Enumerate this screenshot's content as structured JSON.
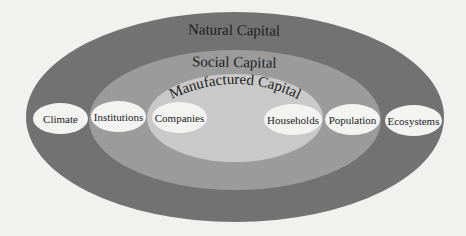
{
  "diagram": {
    "layers": [
      {
        "label": "Natural Capital",
        "color": "#727272"
      },
      {
        "label": "Social Capital",
        "color": "#9b9b9b"
      },
      {
        "label": "Manufactured Capital",
        "color": "#c9c9c9"
      }
    ],
    "nodes": [
      {
        "label": "Climate"
      },
      {
        "label": "Institutions"
      },
      {
        "label": "Companies"
      },
      {
        "label": "Households"
      },
      {
        "label": "Population"
      },
      {
        "label": "Ecosystems"
      }
    ],
    "node_color": "#f3f3f2",
    "background": "#f1f1f0"
  }
}
